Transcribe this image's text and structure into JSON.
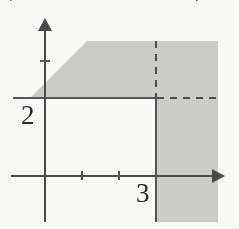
{
  "figure": {
    "name": "inequality-region-graph"
  },
  "labels": {
    "y_intercept": "2",
    "x_intercept": "3"
  },
  "clipped_text": {
    "left_fragment": "y",
    "right_fragment": "y"
  },
  "colors": {
    "shade_fill": "#cfcfcb",
    "axis_stroke": "#4b4b4b",
    "boundary_stroke": "#58585a",
    "label_text": "#2c2c2c",
    "page_background": "#fdfdfc"
  },
  "chart_data": {
    "type": "line",
    "title": "",
    "xlabel": "x",
    "ylabel": "y",
    "xlim": [
      -1,
      6
    ],
    "ylim": [
      -2,
      5
    ],
    "grid": false,
    "legend": "none",
    "x_ticks": [
      "1",
      "2",
      "3"
    ],
    "y_ticks": [
      "2"
    ],
    "boundaries": [
      {
        "name": "y = 2",
        "equation": "y = 2",
        "orientation": "horizontal",
        "value": 2,
        "style_left_of_x3": "solid",
        "style_right_of_x3": "dashed"
      },
      {
        "name": "x = 3",
        "equation": "x = 3",
        "orientation": "vertical",
        "value": 3,
        "style_below_y2": "solid",
        "style_above_y2": "dashed"
      },
      {
        "name": "diagonal-edge",
        "equation": "y = x + 2",
        "orientation": "diagonal",
        "style": "shading-edge"
      }
    ],
    "shaded_regions": [
      {
        "name": "upper-band",
        "description": "region with y greater than or equal to 2, bounded on the lower-left by a diagonal edge",
        "condition": "y >= 2"
      },
      {
        "name": "right-column",
        "description": "region with x greater than or equal to 3, extending below the x-axis",
        "condition": "x >= 3"
      }
    ],
    "corner_point": {
      "x": 3,
      "y": 2
    }
  },
  "annotations": {
    "x_axis_arrow": "arrow-right",
    "y_axis_arrow": "arrow-up"
  }
}
